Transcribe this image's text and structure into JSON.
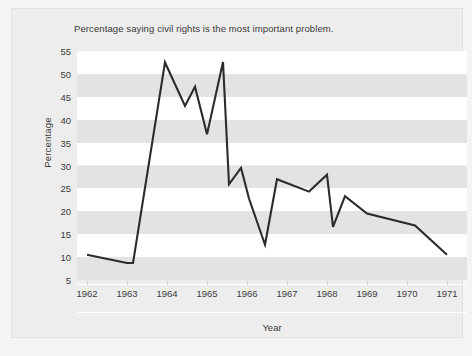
{
  "figure": {
    "title": "Percentage saying civil rights is the most important problem."
  },
  "chart_data": {
    "type": "line",
    "title": "Percentage saying civil rights is the most important problem.",
    "xlabel": "Year",
    "ylabel": "Percentage",
    "xlim": [
      1961.75,
      1971.5
    ],
    "ylim": [
      5,
      55
    ],
    "xticks": [
      1962,
      1963,
      1964,
      1965,
      1966,
      1967,
      1968,
      1969,
      1970,
      1971
    ],
    "xtick_labels": [
      "1962",
      "1963",
      "1964",
      "1965",
      "1966",
      "1967",
      "1968",
      "1969",
      "1970",
      "1971"
    ],
    "yticks": [
      5,
      10,
      15,
      20,
      25,
      30,
      35,
      40,
      45,
      50,
      55
    ],
    "ytick_labels": [
      "5",
      "10",
      "15",
      "20",
      "25",
      "30",
      "35",
      "40",
      "45",
      "50",
      "55"
    ],
    "grid": false,
    "banded_background": true,
    "band_colors": [
      "#ffffff",
      "#e3e3e3"
    ],
    "legend": null,
    "line_color": "#2b2b2b",
    "line_width": 2.1,
    "series": [
      {
        "name": "Civil rights most important problem",
        "x": [
          1962.0,
          1963.0,
          1963.15,
          1963.95,
          1964.45,
          1964.7,
          1965.0,
          1965.4,
          1965.55,
          1965.85,
          1966.05,
          1966.45,
          1966.75,
          1967.55,
          1968.0,
          1968.15,
          1968.45,
          1969.0,
          1970.2,
          1971.0
        ],
        "y": [
          10.5,
          8.7,
          8.7,
          52.5,
          43.0,
          47.2,
          36.8,
          52.6,
          25.9,
          29.5,
          22.8,
          12.7,
          27.0,
          24.3,
          28.0,
          16.6,
          23.3,
          19.5,
          16.9,
          10.5
        ]
      }
    ]
  }
}
